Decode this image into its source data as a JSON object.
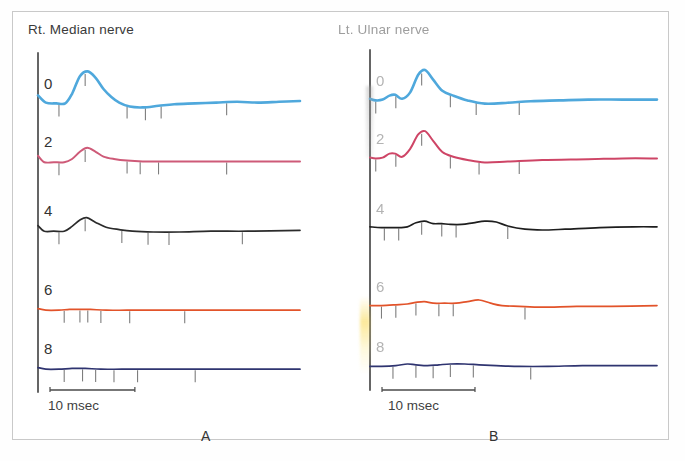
{
  "figure": {
    "panels": [
      {
        "id": "A",
        "letter": "A",
        "title": "Rt. Median nerve",
        "scale_label": "10 msec",
        "rows": [
          {
            "label": "0",
            "color": "#4FA8DC"
          },
          {
            "label": "2",
            "color": "#CE5A78"
          },
          {
            "label": "4",
            "color": "#2B2B2B"
          },
          {
            "label": "6",
            "color": "#E2532A"
          },
          {
            "label": "8",
            "color": "#2F3470"
          }
        ]
      },
      {
        "id": "B",
        "letter": "B",
        "title": "Lt. Ulnar nerve",
        "scale_label": "10 msec",
        "rows": [
          {
            "label": "0",
            "color": "#4FA8DC"
          },
          {
            "label": "2",
            "color": "#CE4566"
          },
          {
            "label": "4",
            "color": "#1E1E1E"
          },
          {
            "label": "6",
            "color": "#E2532A"
          },
          {
            "label": "8",
            "color": "#2F3470"
          }
        ]
      }
    ]
  },
  "chart_data": {
    "type": "line",
    "xlabel": "Time (msec)",
    "ylabel": "Amplitude (arbitrary units)",
    "xlim": [
      0,
      50
    ],
    "grid": false,
    "legend": "none",
    "scale_bar_msec": 10,
    "annotations": [
      "A",
      "B",
      "Rt. Median nerve",
      "Lt. Ulnar nerve",
      "10 msec"
    ],
    "panels": [
      {
        "name": "A",
        "title": "Rt. Median nerve",
        "trace_labels": [
          "0",
          "2",
          "4",
          "6",
          "8"
        ],
        "series": [
          {
            "name": "0",
            "color": "#4FA8DC",
            "x": [
              0,
              1.5,
              3.5,
              5.2,
              6.5,
              8.0,
              9.5,
              11.0,
              12.5,
              14.0,
              15.5,
              17.5,
              20.0,
              23.0,
              26.0,
              30.0,
              34.0,
              38.0,
              42.0,
              46.0,
              50.0
            ],
            "y": [
              12,
              3,
              2,
              2,
              14,
              36,
              42,
              34,
              20,
              10,
              3,
              -2,
              -3,
              -1,
              1,
              2,
              3,
              4,
              3,
              4,
              5
            ],
            "ticks_msec": [
              4.0,
              9.0,
              17.0,
              20.5,
              23.5,
              36.0
            ]
          },
          {
            "name": "2",
            "color": "#CE5A78",
            "x": [
              0,
              1.2,
              3.0,
              5.0,
              6.5,
              8.0,
              9.4,
              11.0,
              12.5,
              14.5,
              17.0,
              20.0,
              24.0,
              28.0,
              33.0,
              38.0,
              44.0,
              50.0
            ],
            "y": [
              9,
              1,
              1,
              1,
              5,
              14,
              19,
              14,
              8,
              5,
              3,
              2,
              2,
              2,
              2,
              2,
              2,
              2
            ],
            "ticks_msec": [
              4.0,
              9.0,
              17.0,
              19.5,
              23.0,
              36.0
            ]
          },
          {
            "name": "4",
            "color": "#2B2B2B",
            "x": [
              0,
              1.2,
              3.0,
              5.0,
              6.5,
              8.0,
              9.3,
              11.0,
              13.0,
              15.5,
              18.0,
              22.0,
              27.0,
              33.0,
              40.0,
              50.0
            ],
            "y": [
              8,
              1,
              1,
              1,
              7,
              15,
              18,
              12,
              6,
              3,
              1,
              0,
              0,
              1,
              1,
              2
            ],
            "ticks_msec": [
              4.0,
              9.0,
              16.0,
              21.0,
              25.0,
              39.0
            ]
          },
          {
            "name": "6",
            "color": "#E2532A",
            "x": [
              0,
              1.5,
              4.0,
              6.0,
              8.0,
              10.0,
              13.0,
              17.0,
              22.0,
              28.0,
              35.0,
              42.0,
              50.0
            ],
            "y": [
              3,
              1,
              1,
              2,
              2,
              2,
              1,
              1,
              1,
              1,
              1,
              1,
              1
            ],
            "ticks_msec": [
              5.0,
              8.0,
              9.5,
              12.0,
              17.5,
              28.0
            ]
          },
          {
            "name": "8",
            "color": "#2F3470",
            "x": [
              0,
              1.5,
              4.0,
              6.5,
              9.0,
              12.0,
              16.0,
              21.0,
              27.0,
              34.0,
              42.0,
              50.0
            ],
            "y": [
              3,
              1,
              1,
              2,
              2,
              1,
              1,
              1,
              1,
              1,
              1,
              1
            ],
            "ticks_msec": [
              5.0,
              8.5,
              11.0,
              14.5,
              19.0,
              30.0
            ]
          }
        ]
      },
      {
        "name": "B",
        "title": "Lt. Ulnar nerve",
        "trace_labels": [
          "0",
          "2",
          "4",
          "6",
          "8"
        ],
        "series": [
          {
            "name": "0",
            "color": "#4FA8DC",
            "x": [
              0,
              1.0,
              2.2,
              3.4,
              4.4,
              5.6,
              7.0,
              8.4,
              9.6,
              11.0,
              12.6,
              14.5,
              17.0,
              20.0,
              24.0,
              28.0,
              33.0,
              38.0,
              44.0,
              50.0
            ],
            "y": [
              4,
              2,
              3,
              8,
              9,
              4,
              12,
              34,
              40,
              28,
              14,
              8,
              2,
              -2,
              -1,
              1,
              2,
              3,
              3,
              3
            ],
            "ticks_msec": [
              1.0,
              4.5,
              9.0,
              14.0,
              18.5,
              26.0
            ]
          },
          {
            "name": "2",
            "color": "#CE4566",
            "x": [
              0,
              1.0,
              2.2,
              3.4,
              4.4,
              5.6,
              7.0,
              8.4,
              9.6,
              11.0,
              12.6,
              14.5,
              17.0,
              20.0,
              24.0,
              30.0,
              38.0,
              44.0,
              50.0
            ],
            "y": [
              3,
              2,
              3,
              8,
              8,
              4,
              14,
              32,
              36,
              24,
              10,
              4,
              0,
              -3,
              -2,
              0,
              1,
              2,
              2
            ],
            "ticks_msec": [
              1.0,
              4.5,
              9.0,
              14.0,
              19.0,
              26.0
            ]
          },
          {
            "name": "4",
            "color": "#1E1E1E",
            "x": [
              0,
              2.0,
              4.5,
              6.5,
              8.0,
              9.5,
              11.0,
              12.5,
              14.0,
              16.0,
              18.0,
              20.0,
              22.0,
              24.0,
              27.0,
              30.0,
              34.0,
              40.0,
              46.0,
              50.0
            ],
            "y": [
              4,
              3,
              3,
              4,
              9,
              11,
              8,
              8,
              7,
              7,
              9,
              11,
              10,
              5,
              1,
              0,
              1,
              3,
              4,
              4
            ],
            "ticks_msec": [
              2.5,
              5.0,
              9.0,
              12.5,
              15.0,
              24.0
            ]
          },
          {
            "name": "6",
            "color": "#E2532A",
            "x": [
              0,
              2.0,
              4.5,
              6.5,
              8.0,
              9.5,
              11.0,
              13.0,
              15.0,
              17.0,
              19.0,
              21.0,
              23.0,
              26.0,
              30.0,
              36.0,
              42.0,
              50.0
            ],
            "y": [
              3,
              3,
              4,
              5,
              7,
              8,
              6,
              6,
              6,
              8,
              10,
              6,
              3,
              2,
              1,
              2,
              2,
              3
            ],
            "ticks_msec": [
              2.0,
              4.5,
              8.0,
              12.0,
              14.5,
              27.0
            ]
          },
          {
            "name": "8",
            "color": "#2F3470",
            "x": [
              0,
              2.0,
              4.5,
              6.5,
              8.0,
              10.0,
              12.0,
              14.0,
              16.5,
              19.0,
              22.0,
              26.0,
              31.0,
              37.0,
              43.0,
              50.0
            ],
            "y": [
              2,
              2,
              3,
              5,
              4,
              3,
              4,
              5,
              5,
              4,
              3,
              2,
              2,
              3,
              3,
              3
            ],
            "ticks_msec": [
              4.0,
              8.0,
              11.0,
              14.0,
              18.0,
              28.0
            ]
          }
        ]
      }
    ]
  }
}
